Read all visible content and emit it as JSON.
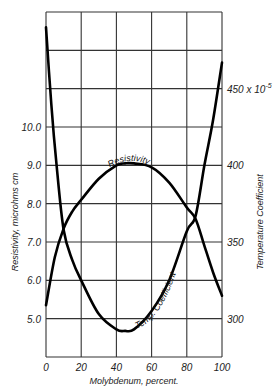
{
  "chart_data": {
    "type": "line",
    "title": "",
    "xlabel": "Molybdenum, percent.",
    "ylabel_left": "Resistivity, microhms cm",
    "ylabel_right": "Temperature Coefficient",
    "xlim": [
      0,
      100
    ],
    "ylim_left": [
      4.0,
      13.0
    ],
    "ylim_right": [
      275,
      500
    ],
    "grid": true,
    "x_ticks": [
      "0",
      "20",
      "40",
      "60",
      "80",
      "100"
    ],
    "left_ticks": [
      {
        "label": "10.0",
        "value": 10.0
      },
      {
        "label": "9.0",
        "value": 9.0
      },
      {
        "label": "8.0",
        "value": 8.0
      },
      {
        "label": "7.0",
        "value": 7.0
      },
      {
        "label": "6.0",
        "value": 6.0
      },
      {
        "label": "5.0",
        "value": 5.0
      }
    ],
    "right_ticks": [
      {
        "label": "450 x 10",
        "sup": "-5",
        "value": 450
      },
      {
        "label": "400",
        "value": 400
      },
      {
        "label": "350",
        "value": 350
      },
      {
        "label": "300",
        "value": 300
      }
    ],
    "series": [
      {
        "name": "Resistivity",
        "axis": "left",
        "x": [
          0,
          5,
          10,
          15,
          20,
          30,
          40,
          45,
          50,
          60,
          70,
          80,
          85,
          90,
          95,
          100
        ],
        "values": [
          5.35,
          6.6,
          7.35,
          7.8,
          8.1,
          8.65,
          9.0,
          9.05,
          9.05,
          8.95,
          8.55,
          7.9,
          7.6,
          6.9,
          6.2,
          5.6
        ]
      },
      {
        "name": "Temp. Coefficient",
        "axis": "right",
        "x": [
          0,
          3,
          6,
          10,
          15,
          20,
          30,
          40,
          45,
          50,
          60,
          70,
          80,
          85,
          90,
          95,
          100
        ],
        "values": [
          490,
          440,
          400,
          358,
          338,
          325,
          303,
          293,
          292,
          293,
          305,
          325,
          357,
          367,
          400,
          430,
          467
        ]
      }
    ],
    "annotations": [
      "Resistivity",
      "Temp. Coefficient"
    ]
  }
}
